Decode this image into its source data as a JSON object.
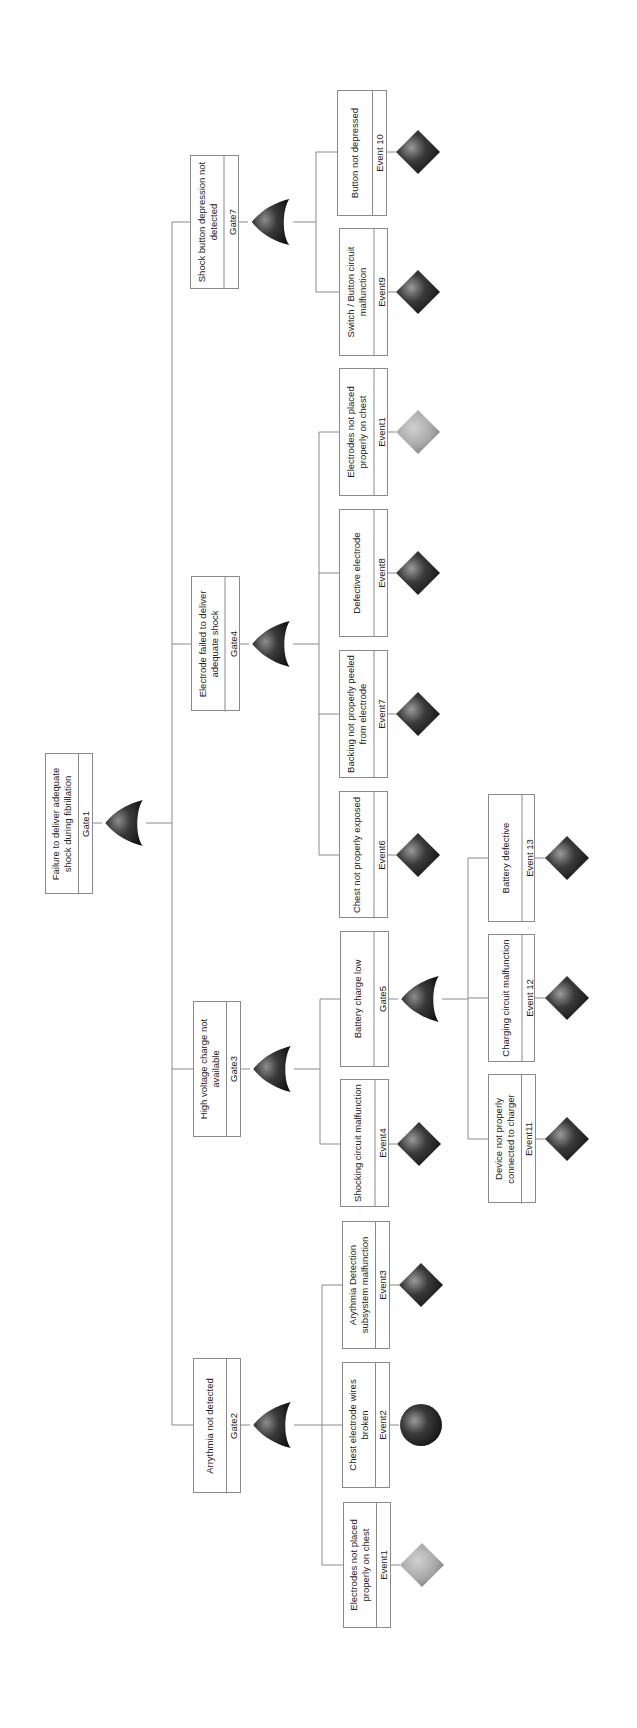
{
  "diagram": {
    "type": "fault-tree",
    "orientation": "rotated-90-ccw",
    "colors": {
      "line": "#8a8a8a",
      "box_border": "#8a8a8a",
      "gate_fill": "#2b2b2b",
      "basic_event_fill": "#2b2b2b",
      "undeveloped_light_fill": "#a8a8a8"
    },
    "nodes": {
      "gate1": {
        "label": "Failure to deliver adequate shock during fibrillation",
        "id": "Gate1",
        "kind": "OR"
      },
      "gate2": {
        "label": "Arrythmia not detected",
        "id": "Gate2",
        "kind": "OR"
      },
      "gate3": {
        "label": "High voltage charge not available",
        "id": "Gate3",
        "kind": "OR"
      },
      "gate4": {
        "label": "Electrode failed to deliver adequate shock",
        "id": "Gate4",
        "kind": "OR"
      },
      "gate5": {
        "label": "Battery charge low",
        "id": "Gate5",
        "kind": "OR"
      },
      "gate7": {
        "label": "Shock button depression not detected",
        "id": "Gate7",
        "kind": "OR"
      },
      "event1a": {
        "label": "Electrodes not placed properly on chest",
        "id": "Event1",
        "symbol": "diamond-light"
      },
      "event2": {
        "label": "Chest electrode wires broken",
        "id": "Event2",
        "symbol": "circle"
      },
      "event3": {
        "label": "Arythmia Detection subsystem malfunction",
        "id": "Event3",
        "symbol": "diamond"
      },
      "event4": {
        "label": "Shocking circuit malfunction",
        "id": "Event4",
        "symbol": "diamond"
      },
      "event6": {
        "label": "Chest not properly exposed",
        "id": "Event6",
        "symbol": "diamond"
      },
      "event7": {
        "label": "Backing not properly peeled from electrode",
        "id": "Event7",
        "symbol": "diamond"
      },
      "event8": {
        "label": "Defective electrode",
        "id": "Event8",
        "symbol": "diamond"
      },
      "event1b": {
        "label": "Electrodes not placed properly on chest",
        "id": "Event1",
        "symbol": "diamond-light"
      },
      "event9": {
        "label": "Switch / Button circuit malfunction",
        "id": "Event9",
        "symbol": "diamond"
      },
      "event10": {
        "label": "Button not depressed",
        "id": "Event 10",
        "symbol": "diamond"
      },
      "event11": {
        "label": "Device not properly connected to charger",
        "id": "Event11",
        "symbol": "diamond"
      },
      "event12": {
        "label": "Charging circuit malfunction",
        "id": "Event 12",
        "symbol": "diamond"
      },
      "event13": {
        "label": "Battery defective",
        "id": "Event 13",
        "symbol": "diamond"
      }
    },
    "tree": {
      "Gate1": [
        "Gate2",
        "Gate3",
        "Gate4",
        "Gate7"
      ],
      "Gate2": [
        "Event1",
        "Event2",
        "Event3"
      ],
      "Gate3": [
        "Event4",
        "Gate5"
      ],
      "Gate5": [
        "Event11",
        "Event 12",
        "Event 13"
      ],
      "Gate4": [
        "Event6",
        "Event7",
        "Event8",
        "Event1"
      ],
      "Gate7": [
        "Event9",
        "Event 10"
      ]
    }
  }
}
